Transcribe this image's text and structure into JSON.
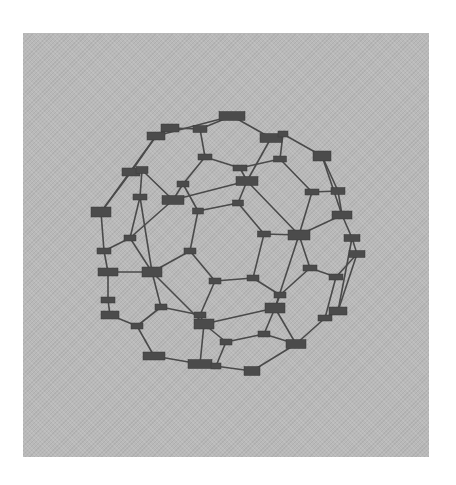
{
  "figure": {
    "type": "graph-diagram",
    "panel_color": "#b9b9b9",
    "node_color": "#4b4b4b",
    "edge_color": "#4a4a4a",
    "node_labels_legible": false
  },
  "nodes": [
    {
      "id": 0,
      "x": 232,
      "y": 116,
      "w": 26,
      "h": 9
    },
    {
      "id": 1,
      "x": 200,
      "y": 129,
      "w": 14,
      "h": 7
    },
    {
      "id": 2,
      "x": 170,
      "y": 128,
      "w": 18,
      "h": 8
    },
    {
      "id": 3,
      "x": 156,
      "y": 136,
      "w": 18,
      "h": 8
    },
    {
      "id": 4,
      "x": 271,
      "y": 138,
      "w": 22,
      "h": 9
    },
    {
      "id": 5,
      "x": 283,
      "y": 134,
      "w": 10,
      "h": 6
    },
    {
      "id": 6,
      "x": 322,
      "y": 156,
      "w": 18,
      "h": 10
    },
    {
      "id": 7,
      "x": 205,
      "y": 157,
      "w": 14,
      "h": 6
    },
    {
      "id": 8,
      "x": 240,
      "y": 168,
      "w": 14,
      "h": 6
    },
    {
      "id": 9,
      "x": 280,
      "y": 159,
      "w": 13,
      "h": 6
    },
    {
      "id": 10,
      "x": 131,
      "y": 172,
      "w": 18,
      "h": 8
    },
    {
      "id": 11,
      "x": 142,
      "y": 170,
      "w": 12,
      "h": 7
    },
    {
      "id": 12,
      "x": 247,
      "y": 181,
      "w": 22,
      "h": 9
    },
    {
      "id": 13,
      "x": 183,
      "y": 184,
      "w": 12,
      "h": 6
    },
    {
      "id": 14,
      "x": 173,
      "y": 200,
      "w": 22,
      "h": 9
    },
    {
      "id": 15,
      "x": 140,
      "y": 197,
      "w": 14,
      "h": 6
    },
    {
      "id": 16,
      "x": 312,
      "y": 192,
      "w": 14,
      "h": 6
    },
    {
      "id": 17,
      "x": 338,
      "y": 191,
      "w": 14,
      "h": 7
    },
    {
      "id": 18,
      "x": 238,
      "y": 203,
      "w": 11,
      "h": 6
    },
    {
      "id": 19,
      "x": 198,
      "y": 211,
      "w": 11,
      "h": 6
    },
    {
      "id": 20,
      "x": 101,
      "y": 212,
      "w": 20,
      "h": 10
    },
    {
      "id": 21,
      "x": 342,
      "y": 215,
      "w": 20,
      "h": 8
    },
    {
      "id": 22,
      "x": 264,
      "y": 234,
      "w": 13,
      "h": 6
    },
    {
      "id": 23,
      "x": 299,
      "y": 235,
      "w": 22,
      "h": 10
    },
    {
      "id": 24,
      "x": 130,
      "y": 238,
      "w": 12,
      "h": 6
    },
    {
      "id": 25,
      "x": 352,
      "y": 238,
      "w": 16,
      "h": 7
    },
    {
      "id": 26,
      "x": 357,
      "y": 254,
      "w": 16,
      "h": 7
    },
    {
      "id": 27,
      "x": 104,
      "y": 251,
      "w": 14,
      "h": 6
    },
    {
      "id": 28,
      "x": 190,
      "y": 251,
      "w": 12,
      "h": 6
    },
    {
      "id": 29,
      "x": 108,
      "y": 272,
      "w": 20,
      "h": 8
    },
    {
      "id": 30,
      "x": 152,
      "y": 272,
      "w": 20,
      "h": 10
    },
    {
      "id": 31,
      "x": 310,
      "y": 268,
      "w": 14,
      "h": 6
    },
    {
      "id": 32,
      "x": 253,
      "y": 278,
      "w": 12,
      "h": 6
    },
    {
      "id": 33,
      "x": 215,
      "y": 281,
      "w": 12,
      "h": 6
    },
    {
      "id": 34,
      "x": 336,
      "y": 277,
      "w": 14,
      "h": 6
    },
    {
      "id": 35,
      "x": 280,
      "y": 295,
      "w": 12,
      "h": 6
    },
    {
      "id": 36,
      "x": 108,
      "y": 300,
      "w": 14,
      "h": 6
    },
    {
      "id": 37,
      "x": 110,
      "y": 315,
      "w": 18,
      "h": 8
    },
    {
      "id": 38,
      "x": 161,
      "y": 307,
      "w": 12,
      "h": 6
    },
    {
      "id": 39,
      "x": 275,
      "y": 308,
      "w": 20,
      "h": 10
    },
    {
      "id": 40,
      "x": 200,
      "y": 315,
      "w": 12,
      "h": 6
    },
    {
      "id": 41,
      "x": 204,
      "y": 324,
      "w": 20,
      "h": 10
    },
    {
      "id": 42,
      "x": 338,
      "y": 311,
      "w": 18,
      "h": 8
    },
    {
      "id": 43,
      "x": 325,
      "y": 318,
      "w": 14,
      "h": 6
    },
    {
      "id": 44,
      "x": 137,
      "y": 326,
      "w": 12,
      "h": 6
    },
    {
      "id": 45,
      "x": 264,
      "y": 334,
      "w": 12,
      "h": 6
    },
    {
      "id": 46,
      "x": 226,
      "y": 342,
      "w": 12,
      "h": 6
    },
    {
      "id": 47,
      "x": 296,
      "y": 344,
      "w": 20,
      "h": 9
    },
    {
      "id": 48,
      "x": 154,
      "y": 356,
      "w": 22,
      "h": 8
    },
    {
      "id": 49,
      "x": 200,
      "y": 364,
      "w": 24,
      "h": 9
    },
    {
      "id": 50,
      "x": 216,
      "y": 366,
      "w": 10,
      "h": 6
    },
    {
      "id": 51,
      "x": 252,
      "y": 371,
      "w": 16,
      "h": 9
    }
  ],
  "edges": [
    [
      0,
      1
    ],
    [
      0,
      4
    ],
    [
      1,
      2
    ],
    [
      2,
      3
    ],
    [
      1,
      7
    ],
    [
      3,
      10
    ],
    [
      4,
      5
    ],
    [
      5,
      6
    ],
    [
      4,
      12
    ],
    [
      5,
      9
    ],
    [
      7,
      8
    ],
    [
      7,
      13
    ],
    [
      8,
      9
    ],
    [
      8,
      12
    ],
    [
      9,
      16
    ],
    [
      6,
      17
    ],
    [
      10,
      11
    ],
    [
      10,
      20
    ],
    [
      11,
      14
    ],
    [
      11,
      15
    ],
    [
      12,
      14
    ],
    [
      12,
      18
    ],
    [
      12,
      23
    ],
    [
      13,
      14
    ],
    [
      13,
      19
    ],
    [
      14,
      24
    ],
    [
      15,
      24
    ],
    [
      15,
      30
    ],
    [
      16,
      17
    ],
    [
      16,
      23
    ],
    [
      17,
      21
    ],
    [
      18,
      19
    ],
    [
      18,
      22
    ],
    [
      19,
      28
    ],
    [
      20,
      27
    ],
    [
      20,
      3
    ],
    [
      21,
      23
    ],
    [
      21,
      25
    ],
    [
      22,
      23
    ],
    [
      22,
      32
    ],
    [
      23,
      31
    ],
    [
      23,
      39
    ],
    [
      24,
      27
    ],
    [
      24,
      30
    ],
    [
      25,
      26
    ],
    [
      26,
      34
    ],
    [
      25,
      42
    ],
    [
      27,
      29
    ],
    [
      28,
      30
    ],
    [
      28,
      33
    ],
    [
      29,
      30
    ],
    [
      29,
      36
    ],
    [
      30,
      41
    ],
    [
      31,
      34
    ],
    [
      31,
      35
    ],
    [
      32,
      33
    ],
    [
      32,
      35
    ],
    [
      33,
      40
    ],
    [
      34,
      43
    ],
    [
      35,
      39
    ],
    [
      36,
      37
    ],
    [
      37,
      44
    ],
    [
      38,
      44
    ],
    [
      38,
      40
    ],
    [
      38,
      30
    ],
    [
      39,
      41
    ],
    [
      39,
      45
    ],
    [
      39,
      47
    ],
    [
      40,
      41
    ],
    [
      41,
      46
    ],
    [
      41,
      49
    ],
    [
      42,
      43
    ],
    [
      43,
      47
    ],
    [
      44,
      48
    ],
    [
      45,
      46
    ],
    [
      45,
      47
    ],
    [
      46,
      50
    ],
    [
      47,
      51
    ],
    [
      48,
      49
    ],
    [
      49,
      50
    ],
    [
      49,
      51
    ],
    [
      6,
      21
    ],
    [
      0,
      3
    ],
    [
      26,
      42
    ]
  ]
}
